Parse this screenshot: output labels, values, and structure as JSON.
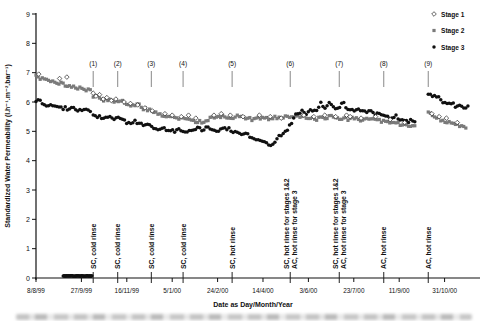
{
  "figure": {
    "xaxis_title": "Date as Day/Month/Year",
    "yaxis_title": "Standardized Water Permeability (l.h⁻¹.m⁻².bar⁻¹)"
  },
  "colors": {
    "stage1": "#222222",
    "stage2": "#7a7a7a",
    "stage3": "#101010",
    "axis": "#111111",
    "event_tick_top": "#888888",
    "event_tick_bottom": "#222222"
  },
  "chart_data": {
    "type": "scatter",
    "title": "",
    "xlabel": "Date as Day/Month/Year",
    "ylabel": "Standardized Water Permeability (l.h⁻¹.m⁻².bar⁻¹)",
    "ylim": [
      0,
      9
    ],
    "grid": false,
    "y_ticks": [
      0,
      1,
      2,
      3,
      4,
      5,
      6,
      7,
      8,
      9
    ],
    "x_axis_days": [
      0,
      489
    ],
    "x_ticks": [
      {
        "day": 0,
        "label": "8/8/99"
      },
      {
        "day": 50,
        "label": "27/9/99"
      },
      {
        "day": 100,
        "label": "16/11/99"
      },
      {
        "day": 150,
        "label": "5/1/00"
      },
      {
        "day": 200,
        "label": "24/2/00"
      },
      {
        "day": 250,
        "label": "14/4/00"
      },
      {
        "day": 300,
        "label": "3/6/00"
      },
      {
        "day": 350,
        "label": "23/7/00"
      },
      {
        "day": 400,
        "label": "11/9/00"
      },
      {
        "day": 450,
        "label": "31/10/00"
      }
    ],
    "legend": {
      "position": "top-right",
      "entries": [
        {
          "label": "Stage 1",
          "marker": "open-diamond"
        },
        {
          "label": "Stage 2",
          "marker": "filled-square"
        },
        {
          "label": "Stage 3",
          "marker": "filled-circle"
        }
      ]
    },
    "events": [
      {
        "num": "(1)",
        "day": 63,
        "label_lines": [
          "SC, cold rinse"
        ]
      },
      {
        "num": "(2)",
        "day": 90,
        "label_lines": [
          "SC, cold rinse"
        ]
      },
      {
        "num": "(3)",
        "day": 127,
        "label_lines": [
          "SC, cold rinse"
        ]
      },
      {
        "num": "(4)",
        "day": 162,
        "label_lines": [
          "SC, cold rinse"
        ]
      },
      {
        "num": "(5)",
        "day": 216,
        "label_lines": [
          "SC, hot rinse"
        ]
      },
      {
        "num": "(6)",
        "day": 280,
        "label_lines": [
          "SC, hot rinse for stages 1&2",
          "AC, hot rinse for stage 3"
        ]
      },
      {
        "num": "(7)",
        "day": 334,
        "label_lines": [
          "SC, hot rinse for stages 1&2",
          "AC, hot rinse for stage 3"
        ]
      },
      {
        "num": "(8)",
        "day": 383,
        "label_lines": [
          "AC, hot rinse"
        ]
      },
      {
        "num": "(9)",
        "day": 432,
        "label_lines": [
          "AC, hot rinse"
        ]
      }
    ],
    "series": [
      {
        "name": "Stage 1",
        "marker": "open-diamond",
        "render": "points",
        "points": [
          [
            3,
            6.95
          ],
          [
            26,
            6.8
          ],
          [
            34,
            6.85
          ],
          [
            63,
            6.3
          ],
          [
            66,
            6.2
          ],
          [
            70,
            6.25
          ],
          [
            74,
            6.1
          ],
          [
            78,
            6.15
          ],
          [
            83,
            6.05
          ],
          [
            88,
            6.1
          ],
          [
            97,
            6.0
          ],
          [
            104,
            5.95
          ],
          [
            112,
            5.9
          ],
          [
            120,
            5.8
          ],
          [
            128,
            5.7
          ],
          [
            142,
            5.6
          ],
          [
            150,
            5.55
          ],
          [
            160,
            5.5
          ],
          [
            168,
            5.55
          ],
          [
            176,
            5.45
          ],
          [
            196,
            5.55
          ],
          [
            204,
            5.6
          ],
          [
            214,
            5.55
          ],
          [
            228,
            5.5
          ],
          [
            246,
            5.55
          ],
          [
            258,
            5.5
          ],
          [
            270,
            5.45
          ],
          [
            295,
            5.55
          ],
          [
            306,
            5.5
          ],
          [
            318,
            5.55
          ],
          [
            330,
            5.5
          ],
          [
            342,
            5.55
          ],
          [
            346,
            5.5
          ],
          [
            358,
            5.45
          ],
          [
            374,
            5.5
          ],
          [
            390,
            5.4
          ],
          [
            406,
            5.3
          ],
          [
            436,
            5.6
          ],
          [
            444,
            5.5
          ],
          [
            452,
            5.45
          ],
          [
            464,
            5.3
          ]
        ]
      },
      {
        "name": "Stage 2",
        "marker": "filled-square",
        "render": "band",
        "step": 2.3,
        "jitter": 0.055,
        "seed": 11,
        "segments": [
          [
            [
              0,
              6.88
            ],
            [
              6,
              6.8
            ],
            [
              12,
              6.75
            ],
            [
              18,
              6.72
            ],
            [
              24,
              6.66
            ],
            [
              30,
              6.6
            ],
            [
              36,
              6.54
            ],
            [
              42,
              6.5
            ],
            [
              48,
              6.46
            ],
            [
              54,
              6.42
            ],
            [
              62,
              6.38
            ]
          ],
          [
            [
              63,
              6.2
            ],
            [
              70,
              6.15
            ],
            [
              76,
              6.05
            ],
            [
              82,
              6.1
            ],
            [
              88,
              6.0
            ],
            [
              94,
              6.02
            ],
            [
              100,
              5.95
            ],
            [
              106,
              5.88
            ],
            [
              112,
              5.92
            ],
            [
              118,
              5.78
            ],
            [
              124,
              5.72
            ],
            [
              130,
              5.64
            ],
            [
              136,
              5.58
            ],
            [
              142,
              5.52
            ],
            [
              150,
              5.46
            ],
            [
              158,
              5.42
            ],
            [
              166,
              5.44
            ],
            [
              174,
              5.36
            ],
            [
              182,
              5.32
            ],
            [
              190,
              5.42
            ],
            [
              198,
              5.46
            ],
            [
              206,
              5.5
            ],
            [
              214,
              5.46
            ],
            [
              222,
              5.5
            ],
            [
              230,
              5.46
            ],
            [
              238,
              5.42
            ],
            [
              246,
              5.46
            ],
            [
              254,
              5.42
            ],
            [
              262,
              5.46
            ],
            [
              270,
              5.5
            ],
            [
              278,
              5.46
            ],
            [
              286,
              5.48
            ],
            [
              294,
              5.5
            ],
            [
              302,
              5.44
            ],
            [
              310,
              5.42
            ],
            [
              318,
              5.46
            ],
            [
              326,
              5.5
            ],
            [
              334,
              5.46
            ],
            [
              342,
              5.42
            ],
            [
              350,
              5.44
            ],
            [
              358,
              5.4
            ],
            [
              366,
              5.42
            ],
            [
              374,
              5.38
            ],
            [
              382,
              5.34
            ],
            [
              390,
              5.3
            ],
            [
              398,
              5.26
            ],
            [
              406,
              5.22
            ],
            [
              412,
              5.18
            ],
            [
              418,
              5.14
            ]
          ],
          [
            [
              432,
              5.62
            ],
            [
              438,
              5.52
            ],
            [
              444,
              5.42
            ],
            [
              450,
              5.34
            ],
            [
              456,
              5.28
            ],
            [
              462,
              5.22
            ],
            [
              468,
              5.18
            ],
            [
              474,
              5.12
            ]
          ]
        ]
      },
      {
        "name": "Stage 3",
        "marker": "filled-circle",
        "render": "band",
        "step": 2.3,
        "jitter": 0.055,
        "seed": 77,
        "segments": [
          [
            [
              0,
              6.0
            ],
            [
              4,
              6.06
            ],
            [
              8,
              5.96
            ],
            [
              12,
              5.9
            ],
            [
              16,
              5.95
            ],
            [
              20,
              5.84
            ],
            [
              24,
              5.88
            ],
            [
              28,
              5.78
            ],
            [
              32,
              5.82
            ],
            [
              36,
              5.76
            ],
            [
              40,
              5.8
            ],
            [
              44,
              5.72
            ],
            [
              48,
              5.76
            ],
            [
              52,
              5.7
            ],
            [
              56,
              5.74
            ],
            [
              62,
              5.7
            ]
          ],
          [
            [
              63,
              5.56
            ],
            [
              68,
              5.5
            ],
            [
              74,
              5.44
            ],
            [
              80,
              5.52
            ],
            [
              86,
              5.4
            ],
            [
              92,
              5.46
            ],
            [
              98,
              5.34
            ],
            [
              104,
              5.28
            ],
            [
              110,
              5.34
            ],
            [
              116,
              5.24
            ],
            [
              122,
              5.28
            ],
            [
              128,
              5.14
            ],
            [
              134,
              5.08
            ],
            [
              140,
              5.14
            ],
            [
              146,
              5.04
            ],
            [
              152,
              5.0
            ],
            [
              158,
              5.06
            ],
            [
              164,
              4.96
            ],
            [
              170,
              5.02
            ],
            [
              176,
              5.1
            ],
            [
              182,
              5.06
            ],
            [
              188,
              5.14
            ],
            [
              194,
              5.08
            ],
            [
              200,
              5.0
            ],
            [
              206,
              5.06
            ],
            [
              212,
              5.1
            ],
            [
              218,
              5.0
            ],
            [
              224,
              4.96
            ],
            [
              230,
              4.9
            ],
            [
              236,
              4.84
            ],
            [
              242,
              4.76
            ],
            [
              248,
              4.66
            ],
            [
              254,
              4.56
            ],
            [
              258,
              4.5
            ],
            [
              262,
              4.62
            ],
            [
              266,
              4.76
            ],
            [
              270,
              4.88
            ],
            [
              274,
              4.98
            ],
            [
              278,
              5.12
            ],
            [
              282,
              5.35
            ],
            [
              286,
              5.6
            ],
            [
              292,
              5.68
            ],
            [
              298,
              5.62
            ],
            [
              304,
              5.72
            ],
            [
              310,
              5.68
            ],
            [
              314,
              5.98
            ],
            [
              318,
              5.78
            ],
            [
              324,
              6.02
            ],
            [
              328,
              5.78
            ],
            [
              334,
              5.84
            ],
            [
              338,
              6.0
            ],
            [
              342,
              5.78
            ],
            [
              348,
              5.72
            ],
            [
              354,
              5.76
            ],
            [
              360,
              5.66
            ],
            [
              366,
              5.7
            ],
            [
              372,
              5.6
            ],
            [
              378,
              5.64
            ],
            [
              384,
              5.54
            ],
            [
              390,
              5.48
            ],
            [
              396,
              5.52
            ],
            [
              402,
              5.42
            ],
            [
              408,
              5.34
            ],
            [
              414,
              5.38
            ],
            [
              418,
              5.26
            ]
          ],
          [
            [
              432,
              6.28
            ],
            [
              436,
              6.2
            ],
            [
              440,
              6.24
            ],
            [
              444,
              6.12
            ],
            [
              448,
              6.02
            ],
            [
              452,
              5.96
            ],
            [
              456,
              6.02
            ],
            [
              460,
              5.9
            ],
            [
              464,
              5.84
            ],
            [
              468,
              5.9
            ],
            [
              472,
              5.8
            ],
            [
              476,
              5.84
            ]
          ]
        ],
        "shutdown_zeros": {
          "day_start": 30,
          "day_end": 62,
          "value": 0.07,
          "step": 0.7,
          "jitter": 0.012
        }
      }
    ]
  }
}
